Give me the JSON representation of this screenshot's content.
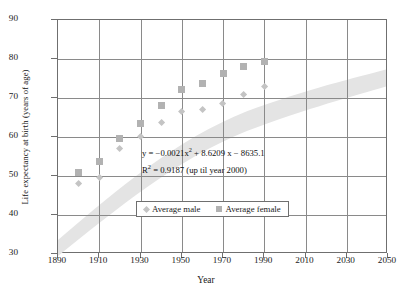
{
  "chart_data": {
    "type": "scatter",
    "title": "",
    "xlabel": "Year",
    "ylabel": "Life expectancy at birth (years of age)",
    "xlim": [
      1890,
      2050
    ],
    "ylim": [
      30,
      90
    ],
    "xticks": [
      1890,
      1910,
      1930,
      1950,
      1970,
      1990,
      2010,
      2030,
      2050
    ],
    "yticks": [
      30,
      40,
      50,
      60,
      70,
      80,
      90
    ],
    "grid": true,
    "legend_position": "inside-bottom-center",
    "x": [
      1900,
      1910,
      1920,
      1930,
      1940,
      1950,
      1960,
      1970,
      1980,
      1990
    ],
    "series": [
      {
        "name": "Average  male",
        "marker": "diamond",
        "color": "#c4c4c4",
        "values": [
          48.0,
          49.5,
          57.0,
          60.0,
          63.7,
          66.5,
          67.0,
          68.5,
          71.0,
          72.8
        ]
      },
      {
        "name": "Average  female",
        "marker": "square",
        "color": "#b2b2b2",
        "values": [
          51.0,
          53.7,
          59.5,
          63.5,
          68.0,
          72.3,
          73.8,
          76.3,
          78.2,
          79.3
        ]
      }
    ],
    "trendband": {
      "color": "#e2e2e2",
      "note": "shaded quadratic trend ribbon spanning 1890-2050"
    },
    "annotations": {
      "equation_line1_pre": "y = −0.0021x",
      "equation_line1_sup": "2",
      "equation_line1_post": " + 8.6209 x − 8635.1",
      "equation_line2_pre": "R",
      "equation_line2_sup": "2",
      "equation_line2_post": " = 0.9187 (up til year 2000)"
    }
  },
  "axis": {
    "x_title": "Year",
    "y_title": "Life expectancy at birth (years of  age)",
    "x_labels": [
      "1890",
      "1910",
      "1930",
      "1950",
      "1970",
      "1990",
      "2010",
      "2030",
      "2050"
    ],
    "y_labels": [
      "90",
      "80",
      "70",
      "60",
      "50",
      "40",
      "30"
    ]
  },
  "legend": {
    "male_label": "Average  male",
    "female_label": "Average  female"
  }
}
